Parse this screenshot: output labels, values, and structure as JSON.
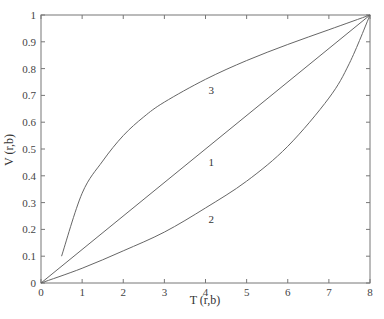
{
  "chart_data": {
    "type": "line",
    "title": "",
    "xlabel": "T (r,b)",
    "ylabel": "V (r,b)",
    "xlim": [
      0,
      8
    ],
    "ylim": [
      0,
      1
    ],
    "grid": false,
    "legend": "none (inline curve labels)",
    "x_ticks": [
      "0",
      "1",
      "2",
      "3",
      "4",
      "5",
      "6",
      "7",
      "8"
    ],
    "y_ticks": [
      "0",
      "0.1",
      "0.2",
      "0.3",
      "0.4",
      "0.5",
      "0.6",
      "0.7",
      "0.8",
      "0.9",
      "1"
    ],
    "series": [
      {
        "name": "1",
        "label_pos": [
          4,
          0.45
        ],
        "x": [
          0,
          8
        ],
        "y": [
          0,
          1
        ]
      },
      {
        "name": "2",
        "label_pos": [
          4,
          0.24
        ],
        "x": [
          0,
          1,
          2,
          3,
          4,
          5,
          6,
          7,
          7.5,
          8
        ],
        "y": [
          0,
          0.055,
          0.12,
          0.19,
          0.28,
          0.38,
          0.51,
          0.69,
          0.82,
          1
        ]
      },
      {
        "name": "3",
        "label_pos": [
          4,
          0.72
        ],
        "x": [
          0.5,
          1,
          1.5,
          2,
          2.5,
          3,
          4,
          5,
          6,
          7,
          8
        ],
        "y": [
          0.1,
          0.335,
          0.455,
          0.55,
          0.62,
          0.675,
          0.76,
          0.83,
          0.89,
          0.945,
          1
        ]
      }
    ]
  }
}
